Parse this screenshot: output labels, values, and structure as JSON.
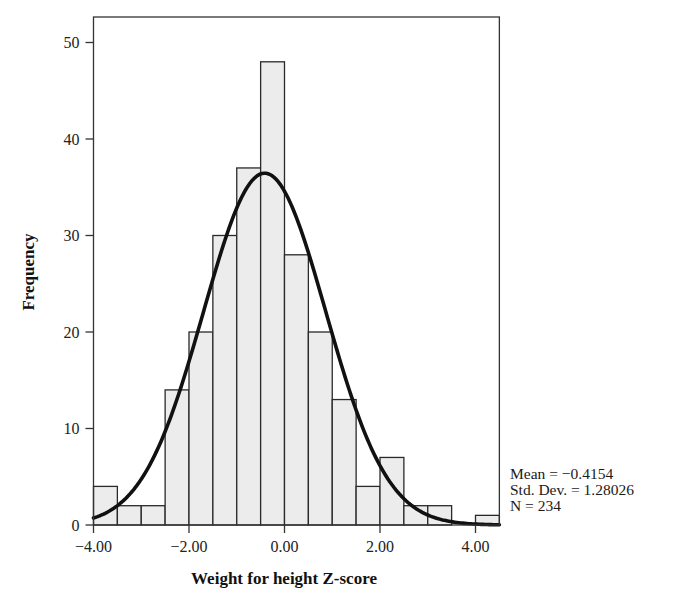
{
  "chart_data": {
    "type": "bar",
    "subtype": "histogram_with_normal_curve",
    "title": "",
    "xlabel": "Weight for height Z-score",
    "ylabel": "Frequency",
    "bin_width": 0.5,
    "bin_edges": [
      -4.0,
      -3.5,
      -3.0,
      -2.5,
      -2.0,
      -1.5,
      -1.0,
      -0.5,
      0.0,
      0.5,
      1.0,
      1.5,
      2.0,
      2.5,
      3.0,
      3.5,
      4.0,
      4.5
    ],
    "categories": [
      "-4.0 to -3.5",
      "-3.5 to -3.0",
      "-3.0 to -2.5",
      "-2.5 to -2.0",
      "-2.0 to -1.5",
      "-1.5 to -1.0",
      "-1.0 to -0.5",
      "-0.5 to 0.0",
      "0.0 to 0.5",
      "0.5 to 1.0",
      "1.0 to 1.5",
      "1.5 to 2.0",
      "2.0 to 2.5",
      "2.5 to 3.0",
      "3.0 to 3.5",
      "3.5 to 4.0",
      "4.0 to 4.5"
    ],
    "values": [
      4,
      2,
      2,
      14,
      20,
      30,
      37,
      48,
      28,
      20,
      13,
      4,
      7,
      2,
      2,
      0,
      1
    ],
    "xlim": [
      -4.0,
      4.5
    ],
    "ylim": [
      0,
      52
    ],
    "x_ticks": [
      -4,
      -2,
      0,
      2,
      4
    ],
    "x_tick_labels": [
      "−4.00",
      "−2.00",
      "0.00",
      "2.00",
      "4.00"
    ],
    "y_ticks": [
      0,
      10,
      20,
      30,
      40,
      50
    ],
    "y_tick_labels": [
      "0",
      "10",
      "20",
      "30",
      "40",
      "50"
    ],
    "grid": false,
    "legend": null,
    "normal_curve": {
      "mean": -0.4154,
      "std_dev": 1.28026,
      "n": 234
    },
    "annotations": [
      "Mean = −0.4154",
      "Std. Dev. = 1.28026",
      "N = 234"
    ],
    "colors": {
      "bar_fill": "#ececec",
      "bar_stroke": "#2a2a2a",
      "curve": "#111111",
      "frame": "#333333"
    }
  },
  "stats": {
    "mean": "Mean = −0.4154",
    "std_dev": "Std. Dev. = 1.28026",
    "n": "N = 234"
  }
}
